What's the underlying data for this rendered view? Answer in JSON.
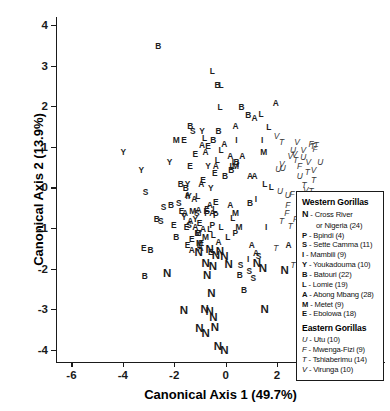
{
  "chart_data": {
    "type": "scatter",
    "title": "",
    "xlabel": "Canonical Axis 1 (49.7%)",
    "ylabel": "Canonical Axis 2 (13.9%)",
    "xlim": [
      -6.6,
      6.2
    ],
    "ylim": [
      -4.3,
      4.2
    ],
    "xticks": [
      -6,
      -4,
      -2,
      0,
      2,
      4,
      6
    ],
    "yticks": [
      -4,
      -3,
      -2,
      -1,
      0,
      1,
      2,
      3,
      4
    ],
    "xticklabels": [
      "-6",
      "-4",
      "-2",
      "0",
      "2",
      "4",
      "6"
    ],
    "yticklabels": [
      "-4",
      "-3",
      "-2",
      "-1",
      "0",
      "1",
      "2",
      "3",
      "4"
    ],
    "grid": false,
    "legend_position": "right-center",
    "marker_style": "text-letter-codes",
    "note": "Each plotted symbol is the site code letter; bold upright = Western Gorillas, italic = Eastern Gorillas.",
    "groups": [
      {
        "name": "Western Gorillas",
        "style": "bold",
        "codes": [
          "N",
          "P",
          "S",
          "I",
          "Y",
          "B",
          "L",
          "A",
          "M",
          "E"
        ]
      },
      {
        "name": "Eastern Gorillas",
        "style": "italic",
        "codes": [
          "U",
          "F",
          "T",
          "V"
        ]
      }
    ],
    "series": [
      {
        "name": "N",
        "group": "Western Gorillas",
        "style": "bold-large",
        "points": [
          [
            -1.05,
            -1.62
          ],
          [
            -0.62,
            -1.55
          ],
          [
            -0.38,
            -1.7
          ],
          [
            -0.22,
            -1.58
          ],
          [
            -0.05,
            -1.72
          ],
          [
            -0.5,
            -1.95
          ],
          [
            -0.78,
            -1.88
          ],
          [
            0.12,
            -1.92
          ],
          [
            1.22,
            -1.88
          ],
          [
            1.45,
            -2.02
          ],
          [
            2.3,
            -2.05
          ],
          [
            -2.28,
            -2.12
          ],
          [
            -0.72,
            -2.18
          ],
          [
            -0.55,
            -2.62
          ],
          [
            -1.62,
            -3.05
          ],
          [
            -0.82,
            -3.02
          ],
          [
            -0.62,
            -3.08
          ],
          [
            -0.48,
            -3.22
          ],
          [
            1.52,
            -3.02
          ],
          [
            -1.02,
            -3.48
          ],
          [
            -0.78,
            -3.62
          ],
          [
            -0.42,
            -3.45
          ],
          [
            -0.3,
            -3.92
          ],
          [
            -0.05,
            -4.02
          ]
        ]
      },
      {
        "name": "B",
        "group": "Western Gorillas",
        "points": [
          [
            -2.62,
            3.48
          ],
          [
            -0.32,
            2.52
          ],
          [
            0.62,
            1.98
          ],
          [
            0.88,
            1.78
          ],
          [
            -1.38,
            1.52
          ],
          [
            -0.28,
            1.38
          ],
          [
            -0.48,
            1.18
          ],
          [
            0.42,
            0.62
          ],
          [
            0.22,
            0.42
          ],
          [
            -0.02,
            0.28
          ],
          [
            -1.75,
            0.08
          ],
          [
            -1.55,
            -0.02
          ],
          [
            -2.12,
            -0.42
          ],
          [
            0.95,
            -0.38
          ],
          [
            -2.68,
            -0.78
          ],
          [
            -1.92,
            -1.22
          ],
          [
            -2.92,
            -1.55
          ],
          [
            -3.15,
            -2.18
          ],
          [
            0.55,
            -2.15
          ],
          [
            0.72,
            -2.52
          ]
        ]
      },
      {
        "name": "L",
        "group": "Western Gorillas",
        "points": [
          [
            -0.52,
            2.88
          ],
          [
            -0.18,
            2.52
          ],
          [
            1.38,
            1.82
          ],
          [
            -0.22,
            1.98
          ],
          [
            1.68,
            1.48
          ],
          [
            -0.82,
            1.22
          ],
          [
            -0.18,
            0.92
          ],
          [
            -0.32,
            0.68
          ],
          [
            0.25,
            0.52
          ],
          [
            1.52,
            0.08
          ],
          [
            1.78,
            0.02
          ],
          [
            -1.08,
            -0.22
          ],
          [
            -0.42,
            -0.52
          ],
          [
            -0.18,
            -0.98
          ],
          [
            -0.48,
            -1.18
          ],
          [
            -1.02,
            -1.42
          ],
          [
            0.28,
            -0.75
          ],
          [
            0.08,
            -1.22
          ],
          [
            -0.62,
            -1.02
          ]
        ]
      },
      {
        "name": "A",
        "group": "Western Gorillas",
        "points": [
          [
            1.95,
            2.08
          ],
          [
            0.38,
            1.52
          ],
          [
            1.12,
            1.72
          ],
          [
            -0.05,
            1.08
          ],
          [
            -0.92,
            1.05
          ],
          [
            -0.78,
            0.88
          ],
          [
            0.18,
            0.78
          ],
          [
            0.65,
            0.78
          ],
          [
            -0.38,
            0.52
          ],
          [
            0.95,
            0.28
          ],
          [
            1.12,
            0.28
          ],
          [
            -0.95,
            0.08
          ],
          [
            -1.48,
            -0.18
          ],
          [
            -1.22,
            -0.28
          ],
          [
            -1.05,
            -0.55
          ],
          [
            -1.58,
            -0.62
          ],
          [
            -1.38,
            -0.82
          ],
          [
            -1.18,
            -0.98
          ],
          [
            -0.88,
            -1.02
          ],
          [
            -0.52,
            -0.62
          ],
          [
            -0.62,
            -0.42
          ],
          [
            0.18,
            -0.42
          ],
          [
            -0.28,
            -1.35
          ],
          [
            2.45,
            -1.42
          ],
          [
            -1.32,
            -1.55
          ],
          [
            -0.98,
            -1.48
          ],
          [
            1.02,
            -1.42
          ],
          [
            1.18,
            -1.62
          ]
        ]
      },
      {
        "name": "Y",
        "group": "Western Gorillas",
        "points": [
          [
            -0.92,
            1.38
          ],
          [
            -3.98,
            0.88
          ],
          [
            -3.28,
            0.42
          ],
          [
            -2.18,
            0.62
          ],
          [
            -1.42,
            -0.22
          ],
          [
            -1.62,
            -0.72
          ],
          [
            -1.18,
            -0.78
          ],
          [
            -0.68,
            0.52
          ],
          [
            -0.58,
            -0.02
          ],
          [
            -1.48,
            0.08
          ]
        ]
      },
      {
        "name": "E",
        "group": "Western Gorillas",
        "points": [
          [
            -1.62,
            1.18
          ],
          [
            -0.68,
            1.02
          ],
          [
            -0.42,
            0.35
          ],
          [
            -0.88,
            0.18
          ],
          [
            -0.38,
            -0.35
          ],
          [
            -1.72,
            -0.58
          ],
          [
            -2.02,
            -0.92
          ],
          [
            -1.08,
            -1.12
          ],
          [
            -1.32,
            -1.28
          ],
          [
            -3.18,
            -1.48
          ],
          [
            -0.95,
            -1.38
          ],
          [
            -1.52,
            -0.98
          ],
          [
            -0.72,
            -0.52
          ],
          [
            -1.18,
            0.82
          ],
          [
            -1.48,
            -1.42
          ],
          [
            -0.58,
            -1.58
          ],
          [
            -1.02,
            -0.88
          ],
          [
            -1.38,
            0.52
          ]
        ]
      },
      {
        "name": "M",
        "group": "Western Gorillas",
        "points": [
          [
            -1.92,
            1.18
          ],
          [
            1.48,
            0.88
          ],
          [
            0.38,
            0.52
          ],
          [
            -1.28,
            -0.58
          ],
          [
            0.38,
            -0.62
          ],
          [
            -1.08,
            -1.12
          ],
          [
            0.52,
            -0.98
          ],
          [
            -0.78,
            -1.22
          ],
          [
            -1.02,
            -1.38
          ]
        ]
      },
      {
        "name": "I",
        "group": "Western Gorillas",
        "points": [
          [
            0.42,
            1.18
          ],
          [
            1.42,
            1.18
          ],
          [
            0.28,
            0.62
          ],
          [
            0.48,
            0.58
          ],
          [
            -1.52,
            -0.22
          ],
          [
            1.18,
            -0.28
          ],
          [
            -0.82,
            -0.58
          ],
          [
            1.58,
            -0.98
          ],
          [
            0.88,
            -1.75
          ]
        ]
      },
      {
        "name": "S",
        "group": "Western Gorillas",
        "points": [
          [
            -1.28,
            1.38
          ],
          [
            -3.12,
            -0.12
          ],
          [
            -2.42,
            -0.48
          ],
          [
            -1.82,
            -0.38
          ],
          [
            -1.12,
            -0.62
          ],
          [
            -2.52,
            -0.82
          ],
          [
            0.58,
            -1.92
          ],
          [
            1.08,
            -2.22
          ],
          [
            0.92,
            -2.05
          ],
          [
            -1.42,
            -0.92
          ],
          [
            1.28,
            -1.68
          ]
        ]
      },
      {
        "name": "P",
        "group": "Western Gorillas",
        "points": [
          [
            -0.72,
            -0.62
          ],
          [
            0.38,
            -1.12
          ],
          [
            -0.52,
            -0.92
          ],
          [
            -0.38,
            -0.68
          ]
        ]
      },
      {
        "name": "U",
        "group": "Eastern Gorillas",
        "style": "italic",
        "points": [
          [
            2.62,
            0.92
          ],
          [
            2.05,
            0.45
          ],
          [
            2.22,
            0.48
          ],
          [
            2.12,
            -0.08
          ],
          [
            2.42,
            -0.18
          ],
          [
            3.28,
            -0.42
          ],
          [
            3.52,
            -0.32
          ],
          [
            3.68,
            0.62
          ],
          [
            2.88,
            0.28
          ],
          [
            3.02,
            0.75
          ]
        ]
      },
      {
        "name": "V",
        "group": "Eastern Gorillas",
        "style": "italic",
        "points": [
          [
            1.98,
            1.28
          ],
          [
            2.52,
            0.78
          ],
          [
            2.68,
            0.82
          ],
          [
            3.22,
            0.62
          ],
          [
            2.18,
            0.58
          ],
          [
            2.92,
            -0.22
          ],
          [
            3.02,
            0.92
          ],
          [
            2.78,
            1.12
          ],
          [
            3.42,
            0.42
          ],
          [
            3.12,
            -0.05
          ]
        ]
      },
      {
        "name": "T",
        "group": "Eastern Gorillas",
        "style": "italic",
        "points": [
          [
            2.18,
            1.12
          ],
          [
            2.72,
            0.68
          ],
          [
            3.38,
            1.02
          ],
          [
            3.52,
            1.05
          ],
          [
            3.18,
            0.38
          ],
          [
            3.42,
            0.18
          ],
          [
            3.32,
            -0.08
          ],
          [
            3.08,
            -0.28
          ],
          [
            2.52,
            -0.95
          ],
          [
            2.82,
            -1.18
          ],
          [
            2.18,
            -0.82
          ],
          [
            1.95,
            -1.48
          ],
          [
            2.62,
            -1.92
          ],
          [
            3.05,
            0.05
          ]
        ]
      },
      {
        "name": "F",
        "group": "Eastern Gorillas",
        "style": "italic",
        "points": [
          [
            2.58,
            -0.15
          ],
          [
            3.12,
            -0.38
          ],
          [
            3.48,
            0.95
          ],
          [
            2.88,
            0.52
          ],
          [
            2.38,
            -0.62
          ],
          [
            2.72,
            -0.78
          ],
          [
            3.05,
            -1.12
          ],
          [
            2.42,
            -0.42
          ],
          [
            3.32,
            1.08
          ]
        ]
      }
    ]
  },
  "axes": {
    "xlabel": "Canonical Axis 1 (49.7%)",
    "ylabel": "Canonical Axis 2 (13.9%)",
    "xticklabels": [
      "-6",
      "-4",
      "-2",
      "0",
      "2",
      "4",
      "6"
    ],
    "yticklabels": [
      "4",
      "3",
      "2",
      "1",
      "0",
      "-1",
      "-2",
      "-3",
      "-4"
    ]
  },
  "legend": {
    "sections": [
      {
        "heading": "Western Gorillas",
        "entries": [
          {
            "key": "N",
            "key_style": "bold-large",
            "label": "- Cross River",
            "continuation": "or Nigeria (24)"
          },
          {
            "key": "P",
            "key_style": "bold",
            "label": "- Bpindi (4)"
          },
          {
            "key": "S",
            "key_style": "bold",
            "label": "- Sette Camma (11)"
          },
          {
            "key": "I",
            "key_style": "bold",
            "label": "- Mambili (9)"
          },
          {
            "key": "Y",
            "key_style": "bold",
            "label": "- Youkadouma (10)"
          },
          {
            "key": "B",
            "key_style": "bold",
            "label": "- Batouri (22)"
          },
          {
            "key": "L",
            "key_style": "bold",
            "label": "- Lomie (19)"
          },
          {
            "key": "A",
            "key_style": "bold",
            "label": "- Abong Mbang (28)"
          },
          {
            "key": "M",
            "key_style": "bold",
            "label": "- Metet (9)"
          },
          {
            "key": "E",
            "key_style": "bold",
            "label": "- Ebolowa (18)"
          }
        ]
      },
      {
        "heading": "Eastern Gorillas",
        "entries": [
          {
            "key": "U",
            "key_style": "italic",
            "label": "- Utu (10)"
          },
          {
            "key": "F",
            "key_style": "italic",
            "label": "- Mwenga-Fizi (9)"
          },
          {
            "key": "T",
            "key_style": "italic",
            "label": "- Tshiaberimu (14)"
          },
          {
            "key": "V",
            "key_style": "italic",
            "label": "- Virunga (10)"
          }
        ]
      }
    ]
  }
}
